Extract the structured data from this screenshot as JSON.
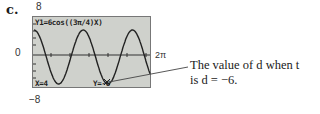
{
  "part_label": "c.",
  "window": {
    "ymax_label": "8",
    "ymin_label": "−8",
    "origin_label": "0",
    "xmax_label": "2π"
  },
  "calculator": {
    "equation": "Y1=6cos((3π/4)X)",
    "trace_x": "X=4",
    "trace_y": "Y=-6"
  },
  "annotation": {
    "line1": "The value of d when t = 4",
    "line2": "is d = −6."
  },
  "chart_data": {
    "type": "line",
    "title": "Y1=6cos((3π/4)X)",
    "function": "6*cos((3*pi/4)*x)",
    "xlim": [
      0,
      6.283
    ],
    "ylim": [
      -8,
      8
    ],
    "xlabel": "",
    "ylabel": "",
    "tick_labels": {
      "y_top": "8",
      "y_bottom": "−8",
      "y_axis": "0",
      "x_right": "2π"
    },
    "x": [
      0,
      0.5,
      1,
      1.333,
      1.5,
      2,
      2.5,
      2.667,
      3,
      3.5,
      4,
      4.5,
      5,
      5.333,
      5.5,
      6,
      6.283
    ],
    "y": [
      6,
      4.16,
      -4.24,
      -6,
      -5.54,
      0,
      5.54,
      6,
      4.24,
      -2.3,
      -6,
      -2.3,
      4.24,
      6,
      5.54,
      0,
      -3.0
    ],
    "highlighted_point": {
      "x": 4,
      "y": -6,
      "label": "Y=-6"
    },
    "grid": false
  }
}
